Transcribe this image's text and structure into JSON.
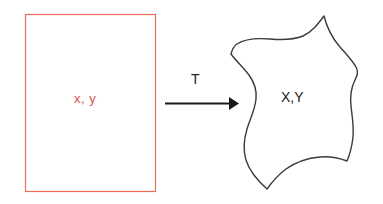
{
  "diagram": {
    "type": "mapping-diagram",
    "background_color": "#ffffff",
    "source_region": {
      "shape": "rectangle",
      "label": "x, y",
      "label_color": "#d9534f",
      "stroke_color": "#ef6d5a",
      "fill_color": "#ffffff",
      "stroke_width": 1,
      "x": 25,
      "y": 14,
      "width": 131,
      "height": 178
    },
    "mapping_arrow": {
      "label": "T",
      "label_color": "#222222",
      "stroke_color": "#1a1a1a",
      "stroke_width": 2,
      "x_start": 165,
      "x_end": 238,
      "y": 103,
      "direction": "right"
    },
    "target_region": {
      "shape": "blob",
      "label": "X,Y",
      "label_color": "#1a1a1a",
      "stroke_color": "#3a3a3a",
      "fill_color": "#ffffff",
      "stroke_width": 1.4,
      "bounds": {
        "x": 231,
        "y": 15,
        "width": 126,
        "height": 176
      }
    }
  }
}
